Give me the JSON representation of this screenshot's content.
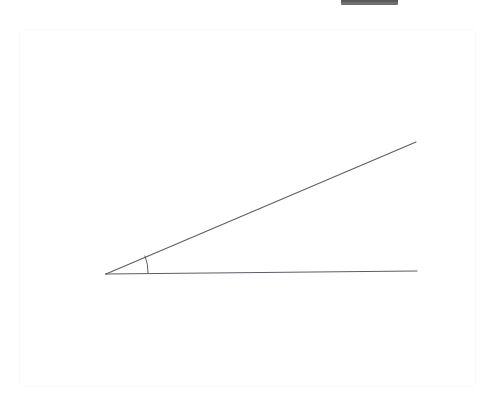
{
  "figure": {
    "title": "Acute angle formed by two rays",
    "background_color": "#ffffff",
    "canvas": {
      "x": 19,
      "y": 29,
      "width": 457,
      "height": 358,
      "border_color": "#fafafa",
      "fill_color": "#ffffff"
    },
    "top_bar": {
      "x": 341,
      "y": 0,
      "width": 57,
      "height": 5,
      "color": "#6f6f6f",
      "shadow_color": "#5a5a5a"
    },
    "stroke_color": "#5d5d66",
    "stroke_width": 1,
    "vertex": {
      "x": 106,
      "y": 274,
      "label": ""
    },
    "rays": [
      {
        "name": "lower-ray",
        "from": {
          "x": 106,
          "y": 274
        },
        "to": {
          "x": 417,
          "y": 271
        },
        "label": ""
      },
      {
        "name": "upper-ray",
        "from": {
          "x": 106,
          "y": 274
        },
        "to": {
          "x": 416,
          "y": 142
        },
        "label": ""
      }
    ],
    "angle_arc": {
      "radius": 42,
      "start": {
        "x": 148,
        "y": 273
      },
      "end": {
        "x": 145,
        "y": 256
      },
      "measure_degrees": 23,
      "label": ""
    }
  },
  "chart_data": {
    "type": "scatter",
    "title": "Acute angle formed by two rays",
    "xlabel": "",
    "ylabel": "",
    "annotations": [],
    "series": [
      {
        "name": "lower-ray",
        "x": [
          106,
          417
        ],
        "y": [
          274,
          271
        ]
      },
      {
        "name": "upper-ray",
        "x": [
          106,
          416
        ],
        "y": [
          274,
          142
        ]
      }
    ],
    "measured_angle_degrees": 23,
    "grid": false,
    "legend": "none"
  }
}
